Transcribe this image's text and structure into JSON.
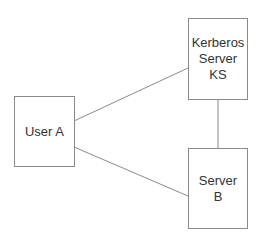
{
  "diagram": {
    "nodes": [
      {
        "id": "user-a",
        "lines": [
          "User A"
        ]
      },
      {
        "id": "kerberos-server",
        "lines": [
          "Kerberos",
          "Server",
          "KS"
        ]
      },
      {
        "id": "server-b",
        "lines": [
          "Server",
          "B"
        ]
      }
    ],
    "edges": [
      {
        "from": "user-a",
        "to": "kerberos-server"
      },
      {
        "from": "user-a",
        "to": "server-b"
      },
      {
        "from": "kerberos-server",
        "to": "server-b"
      }
    ],
    "colors": {
      "stroke": "#8a8a8a",
      "text": "#333333",
      "background": "#ffffff"
    }
  }
}
